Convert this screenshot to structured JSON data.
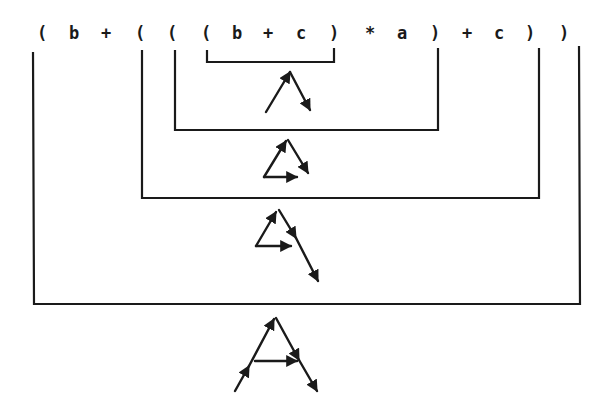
{
  "expression": {
    "text": "( b + ( ( ( b + c ) * a ) + c ) )",
    "tokens": [
      {
        "t": "(",
        "x": 42
      },
      {
        "t": "b",
        "x": 74
      },
      {
        "t": "+",
        "x": 106
      },
      {
        "t": "(",
        "x": 140
      },
      {
        "t": "(",
        "x": 172
      },
      {
        "t": "(",
        "x": 206
      },
      {
        "t": "b",
        "x": 237
      },
      {
        "t": "+",
        "x": 268
      },
      {
        "t": "c",
        "x": 301
      },
      {
        "t": ")",
        "x": 334
      },
      {
        "t": "*",
        "x": 370
      },
      {
        "t": "a",
        "x": 402
      },
      {
        "t": ")",
        "x": 435
      },
      {
        "t": "+",
        "x": 467
      },
      {
        "t": "c",
        "x": 499
      },
      {
        "t": ")",
        "x": 530
      },
      {
        "t": ")",
        "x": 564
      }
    ]
  },
  "colors": {
    "ink": "#1a1a1a",
    "background": "#ffffff"
  },
  "brackets": [
    {
      "level": 4,
      "subexpr": "(b + c)",
      "x1": 207,
      "x2": 334,
      "top": 50,
      "bottom": 62
    },
    {
      "level": 3,
      "subexpr": "((b + c) * a)",
      "x1": 175,
      "x2": 438,
      "top": 50,
      "bottom": 130
    },
    {
      "level": 2,
      "subexpr": "(((b + c) * a) + c)",
      "x1": 142,
      "x2": 539,
      "top": 50,
      "bottom": 198
    },
    {
      "level": 1,
      "subexpr": "(b + (((b + c) * a) + c))",
      "x1": 33,
      "x2": 580,
      "top": 52,
      "bottom": 304
    }
  ],
  "trees": [
    {
      "level": 4,
      "label": "tree-b-plus-c",
      "description": "two-edge vector tree (b, c)"
    },
    {
      "level": 3,
      "label": "tree-times-a",
      "description": "triangle with a edge"
    },
    {
      "level": 2,
      "label": "tree-plus-c",
      "description": "triangle with extended c edge"
    },
    {
      "level": 1,
      "label": "tree-full-A",
      "description": "A-shaped vector figure"
    }
  ]
}
